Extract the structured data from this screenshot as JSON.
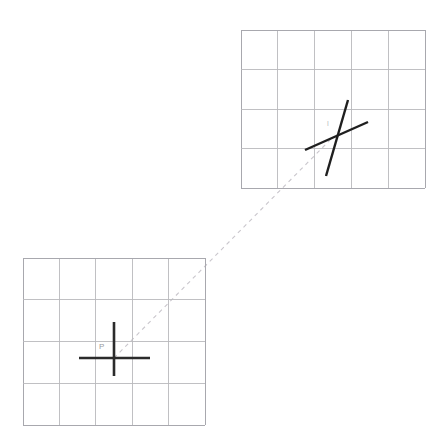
{
  "figure": {
    "background_color": "#ffffff",
    "width": 445,
    "height": 444
  },
  "colors": {
    "grid": "#b9b9bd",
    "grid_major": "#a8a8ae",
    "cross": "#2b2b2b",
    "cross_skew": "#1f1f1f",
    "connector": "#c9c6cc",
    "label": "#9a9aa0",
    "label_faint": "#c0bfc4"
  },
  "grids": [
    {
      "id": "target-grid",
      "name": "upper-right-grid",
      "x": 241,
      "y": 30,
      "width": 184,
      "height": 158,
      "columns": 5,
      "rows": 4,
      "cell_width": 36.8,
      "cell_height": 39.5,
      "vertical_lines": [
        241,
        277.8,
        314.6,
        351.4,
        388.2,
        425
      ],
      "horizontal_lines": [
        30,
        69.5,
        109,
        148.5,
        188
      ]
    },
    {
      "id": "source-grid",
      "name": "lower-left-grid",
      "x": 23,
      "y": 258,
      "width": 182,
      "height": 167,
      "columns": 5,
      "rows": 4,
      "cell_width": 36.4,
      "cell_height": 41.75,
      "vertical_lines": [
        23,
        59.4,
        95.8,
        132.2,
        168.6,
        205
      ],
      "horizontal_lines": [
        258,
        299.75,
        341.5,
        383.25,
        425
      ]
    }
  ],
  "markers": [
    {
      "id": "marker-p",
      "name": "source-cross-marker",
      "label": "P",
      "label_x": 99,
      "label_y": 347,
      "label_style": "normal",
      "center_x": 114,
      "center_y": 358,
      "strokes": [
        {
          "x1": 79,
          "y1": 358,
          "x2": 150,
          "y2": 358
        },
        {
          "x1": 114,
          "y1": 322,
          "x2": 114,
          "y2": 376
        }
      ]
    },
    {
      "id": "marker-p-prime",
      "name": "target-cross-marker",
      "label": "l",
      "label_x": 327,
      "label_y": 124,
      "label_style": "faint",
      "center_x": 333,
      "center_y": 137,
      "strokes": [
        {
          "x1": 305,
          "y1": 150,
          "x2": 368,
          "y2": 122
        },
        {
          "x1": 348,
          "y1": 100,
          "x2": 326,
          "y2": 176
        }
      ]
    }
  ],
  "connector": {
    "id": "correspondence-line",
    "name": "correspondence-dashed-line",
    "style": "dashed",
    "from_x": 114,
    "from_y": 358,
    "to_x": 333,
    "to_y": 137
  }
}
